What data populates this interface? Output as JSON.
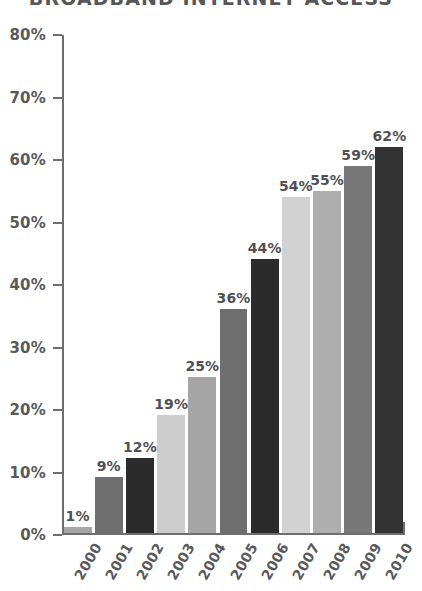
{
  "chart_data": {
    "type": "bar",
    "title": "BROADBAND INTERNET ACCESS",
    "xlabel": "",
    "ylabel": "",
    "ylim": [
      0,
      80
    ],
    "ytick_labels": [
      "0%",
      "10%",
      "20%",
      "30%",
      "40%",
      "50%",
      "60%",
      "70%",
      "80%"
    ],
    "ytick_values": [
      0,
      10,
      20,
      30,
      40,
      50,
      60,
      70,
      80
    ],
    "grid": false,
    "legend": false,
    "categories": [
      "2000",
      "2001",
      "2002",
      "2003",
      "2004",
      "2005",
      "2006",
      "2007",
      "2008",
      "2009",
      "2010"
    ],
    "values": [
      1,
      9,
      12,
      19,
      25,
      36,
      44,
      54,
      55,
      59,
      62
    ],
    "value_labels": [
      "1%",
      "9%",
      "12%",
      "19%",
      "25%",
      "36%",
      "44%",
      "54%",
      "55%",
      "59%",
      "62%"
    ],
    "bar_colors": [
      "#a5a5a5",
      "#6e6e6e",
      "#2b2b2b",
      "#cdcdcd",
      "#a5a5a5",
      "#6e6e6e",
      "#2b2b2b",
      "#d2d2d2",
      "#aeaeae",
      "#787878",
      "#333333"
    ]
  },
  "colors": {
    "axis": "#6c6e70",
    "title_text": "#555759",
    "tick_text": "#58595b",
    "value_text": "#4f5052",
    "background": "#ffffff"
  }
}
